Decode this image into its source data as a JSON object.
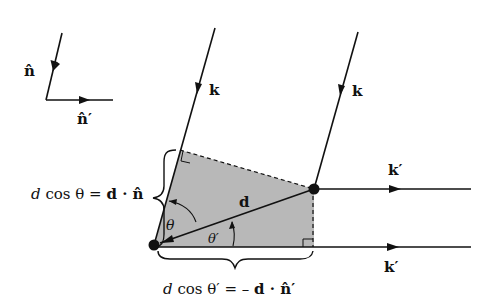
{
  "colors": {
    "ink": "#111111",
    "shade": "#b8b8b8",
    "background": "#ffffff"
  },
  "legend": {
    "n_hat_label": "n̂",
    "n_hat_prime_label": "n̂′"
  },
  "beams": {
    "incident_left_label": "k",
    "incident_right_label": "k",
    "scattered_top_label": "k′",
    "scattered_bottom_label": "k′"
  },
  "vector": {
    "d_label": "d"
  },
  "angles": {
    "theta_label": "θ",
    "theta_prime_label": "θ′"
  },
  "equations": {
    "left_d": "d",
    "left_rest": " cos θ = ",
    "left_vec": "d · n̂",
    "bottom_d": "d",
    "bottom_rest": " cos θ′ = – ",
    "bottom_vec": "d · n̂′"
  }
}
